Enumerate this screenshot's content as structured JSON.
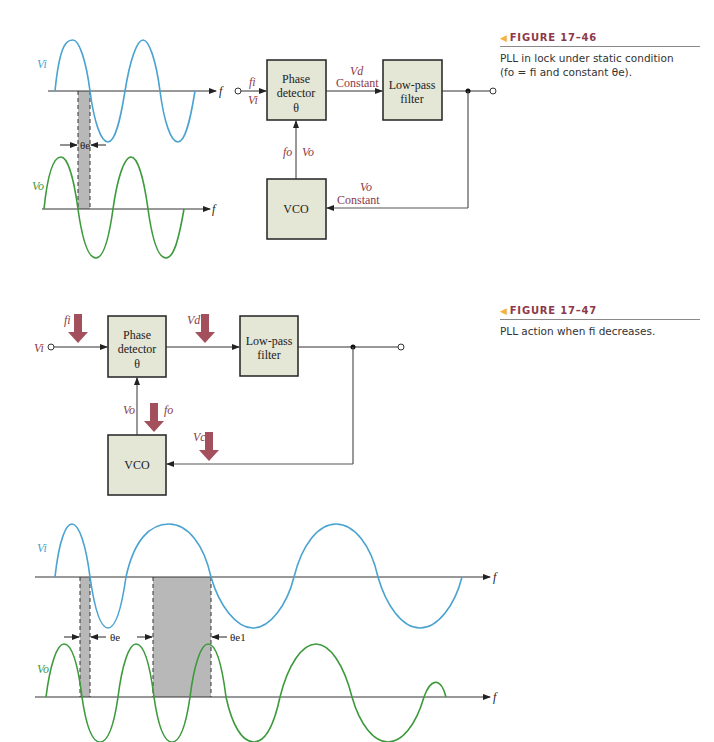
{
  "figure_46": {
    "label": "FIGURE 17–46",
    "caption_line1": "PLL in lock under static condition",
    "caption_line2": "(fo = fi and constant θe).",
    "blocks": {
      "phase_detector_1": "Phase",
      "phase_detector_2": "detector",
      "phase_detector_3": "θ",
      "lowpass_1": "Low-pass",
      "lowpass_2": "filter",
      "vco": "VCO"
    },
    "signals": {
      "fi": "fi",
      "vi": "Vi",
      "vd": "Vd",
      "vd_state": "Constant",
      "fo": "fo",
      "vo": "Vo",
      "vo_fb": "Vo",
      "vo_fb_state": "Constant"
    },
    "waveforms": {
      "input_label": "Vi",
      "output_label": "Vo",
      "axis_label": "f",
      "phase_label": "θe"
    }
  },
  "figure_47": {
    "label": "FIGURE 17–47",
    "caption": "PLL action when fi decreases.",
    "blocks": {
      "phase_detector_1": "Phase",
      "phase_detector_2": "detector",
      "phase_detector_3": "θ",
      "lowpass_1": "Low-pass",
      "lowpass_2": "filter",
      "vco": "VCO"
    },
    "signals": {
      "vi": "Vi",
      "fi": "fi",
      "vd": "Vd",
      "vo": "Vo",
      "fo": "fo",
      "vc": "Vc"
    },
    "waveforms": {
      "input_label": "Vi",
      "output_label": "Vo",
      "axis_label": "f",
      "phase_label_1": "θe",
      "phase_label_2": "θe1"
    }
  },
  "colors": {
    "input_wave": "#4aa3d0",
    "output_wave": "#3d9a3d",
    "block_fill": "#e4e6d6",
    "signal_text": "#8b3a4a",
    "arrow_fill": "#a3505c",
    "shade": "#b8b8b8",
    "accent": "#f2b33c"
  }
}
